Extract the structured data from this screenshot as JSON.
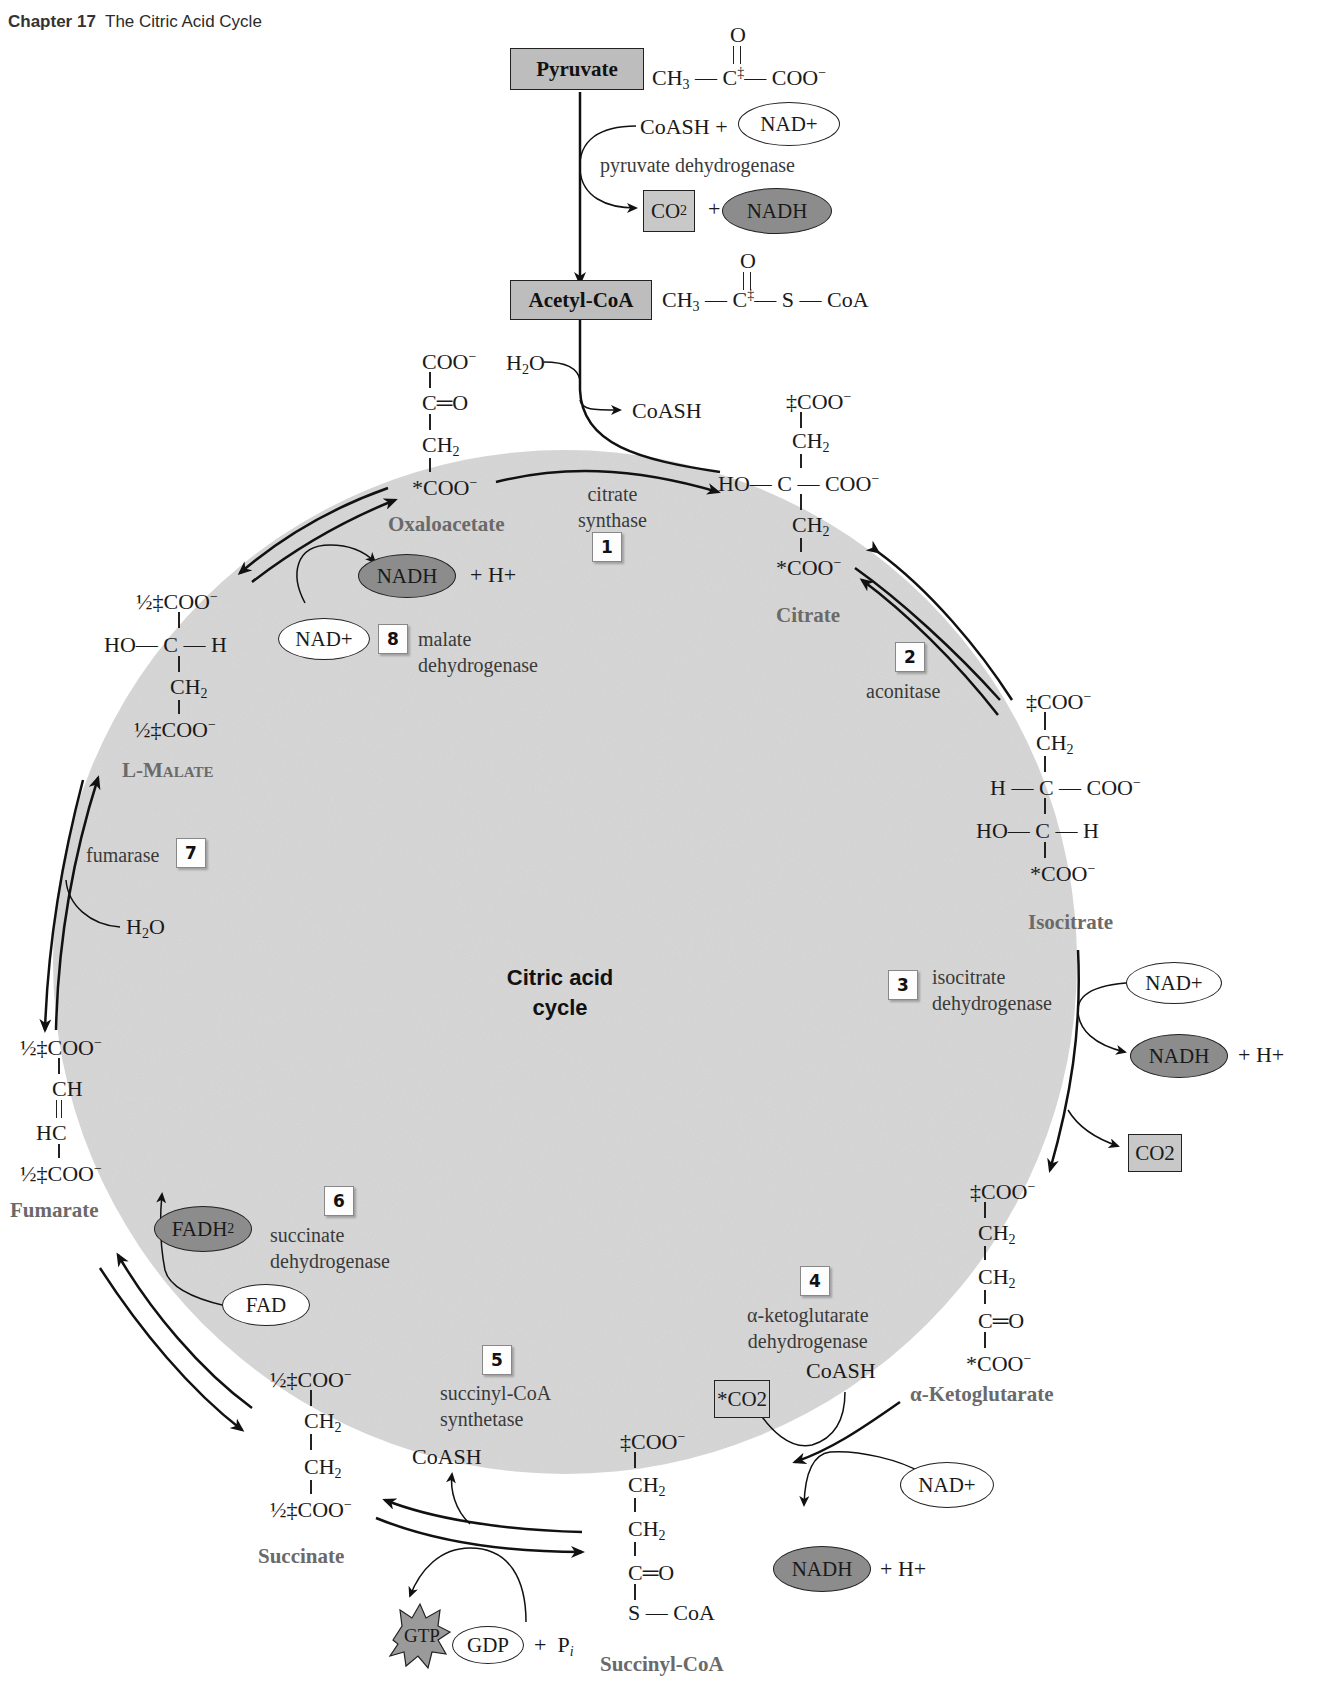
{
  "header": {
    "chapter": "Chapter 17",
    "title": "The Citric Acid Cycle"
  },
  "center_label": {
    "line1": "Citric acid",
    "line2": "cycle"
  },
  "entry": {
    "pyruvate": {
      "label": "Pyruvate",
      "formula": "CH3—C‡(=O)—COO⁻"
    },
    "pdh": {
      "substrates": "CoASH +",
      "nad": "NAD+",
      "enzyme": "pyruvate dehydrogenase",
      "co2": "CO2",
      "plus": "+",
      "nadh": "NADH"
    },
    "acetyl_coa": {
      "label": "Acetyl-CoA",
      "formula": "CH3—C‡(=O)—S—CoA"
    }
  },
  "intermediates": [
    {
      "name": "Oxaloacetate",
      "lines": [
        "COO⁻",
        "C=O",
        "CH2",
        "*COO⁻"
      ]
    },
    {
      "name": "Citrate",
      "lines": [
        "‡COO⁻",
        "CH2",
        "HO—C—COO⁻",
        "CH2",
        "*COO⁻"
      ]
    },
    {
      "name": "Isocitrate",
      "lines": [
        "‡COO⁻",
        "CH2",
        "H—C—COO⁻",
        "HO—C—H",
        "*COO⁻"
      ]
    },
    {
      "name": "α-Ketoglutarate",
      "lines": [
        "‡COO⁻",
        "CH2",
        "CH2",
        "C=O",
        "*COO⁻"
      ]
    },
    {
      "name": "Succinyl-CoA",
      "lines": [
        "‡COO⁻",
        "CH2",
        "CH2",
        "C=O",
        "S—CoA"
      ]
    },
    {
      "name": "Succinate",
      "lines": [
        "½‡COO⁻",
        "CH2",
        "CH2",
        "½‡COO⁻"
      ]
    },
    {
      "name": "Fumarate",
      "lines": [
        "½‡COO⁻",
        "CH",
        "HC",
        "½‡COO⁻"
      ]
    },
    {
      "name": "L-Malate",
      "lines": [
        "½‡COO⁻",
        "HO—C—H",
        "CH2",
        "½‡COO⁻"
      ]
    }
  ],
  "steps": [
    {
      "number": "1",
      "enzyme_line1": "citrate",
      "enzyme_line2": "synthase",
      "inputs": [
        "H2O"
      ],
      "outputs": [
        "CoASH"
      ]
    },
    {
      "number": "2",
      "enzyme_line1": "aconitase",
      "enzyme_line2": ""
    },
    {
      "number": "3",
      "enzyme_line1": "isocitrate",
      "enzyme_line2": "dehydrogenase",
      "inputs": [
        "NAD+"
      ],
      "outputs": [
        "NADH",
        "+ H+",
        "CO2"
      ]
    },
    {
      "number": "4",
      "enzyme_line1": "α-ketoglutarate",
      "enzyme_line2": "dehydrogenase",
      "inputs": [
        "CoASH",
        "NAD+"
      ],
      "outputs": [
        "*CO2",
        "NADH",
        "+ H+"
      ]
    },
    {
      "number": "5",
      "enzyme_line1": "succinyl-CoA",
      "enzyme_line2": "synthetase",
      "inputs": [
        "GDP",
        "+ Pi"
      ],
      "outputs": [
        "CoASH",
        "GTP"
      ]
    },
    {
      "number": "6",
      "enzyme_line1": "succinate",
      "enzyme_line2": "dehydrogenase",
      "inputs": [
        "FAD"
      ],
      "outputs": [
        "FADH2"
      ]
    },
    {
      "number": "7",
      "enzyme_line1": "fumarase",
      "enzyme_line2": "",
      "inputs": [
        "H2O"
      ]
    },
    {
      "number": "8",
      "enzyme_line1": "malate",
      "enzyme_line2": "dehydrogenase",
      "inputs": [
        "NAD+"
      ],
      "outputs": [
        "NADH",
        "+ H+"
      ]
    }
  ],
  "colors": {
    "cycle_fill": "#d6d6d6",
    "nadh_fill": "#8c8c8c",
    "co2_fill": "#c8c8c8",
    "gtp_fill": "#9a9a9a",
    "intermediate_name": "#6a6a6a"
  }
}
